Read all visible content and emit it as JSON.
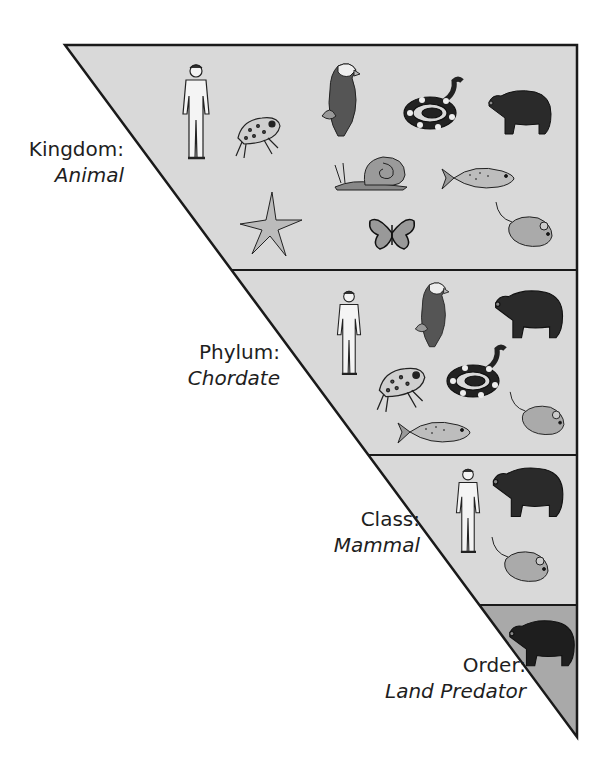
{
  "diagram": {
    "type": "taxonomy-inverted-triangle",
    "colors": {
      "upper_fill": "#d9d9d9",
      "order_fill": "#a9a9a9",
      "outline": "#1a1a1a",
      "background": "#ffffff",
      "label_text": "#1e1e1e"
    },
    "levels": [
      {
        "rank": "Kingdom:",
        "taxon": "Animal",
        "animals": [
          "human",
          "frog",
          "eagle",
          "snake",
          "bear",
          "snail",
          "fish",
          "starfish",
          "butterfly",
          "mouse"
        ]
      },
      {
        "rank": "Phylum:",
        "taxon": "Chordate",
        "animals": [
          "human",
          "eagle",
          "bear",
          "frog",
          "snake",
          "mouse",
          "fish"
        ]
      },
      {
        "rank": "Class:",
        "taxon": "Mammal",
        "animals": [
          "human",
          "bear",
          "mouse"
        ]
      },
      {
        "rank": "Order:",
        "taxon": "Land Predator",
        "animals": [
          "bear"
        ]
      }
    ]
  }
}
